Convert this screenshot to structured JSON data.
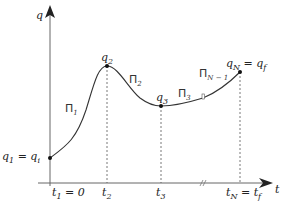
{
  "diagram": {
    "axes": {
      "y_label": "q",
      "x_label": "t"
    },
    "points": [
      {
        "id": "q1",
        "label": "q",
        "sub": "1",
        "eq": " = q",
        "eq_sub": "i"
      },
      {
        "id": "q2",
        "label": "q",
        "sub": "2"
      },
      {
        "id": "q3",
        "label": "q",
        "sub": "3"
      },
      {
        "id": "qN",
        "label": "q",
        "sub": "N",
        "eq": " = q",
        "eq_sub": "f"
      }
    ],
    "segments": [
      {
        "label": "Π",
        "sub": "1"
      },
      {
        "label": "Π",
        "sub": "2"
      },
      {
        "label": "Π",
        "sub": "3"
      },
      {
        "label": "Π",
        "sub": "N − 1"
      }
    ],
    "time_ticks": [
      {
        "label": "t",
        "sub": "1",
        "suffix": " = 0"
      },
      {
        "label": "t",
        "sub": "2"
      },
      {
        "label": "t",
        "sub": "3"
      },
      {
        "label": "t",
        "sub": "N",
        "suffix": " = t",
        "suffix_sub": "f"
      }
    ],
    "colors": {
      "line": "#333333",
      "dashed": "#555555",
      "background": "#ffffff"
    }
  }
}
